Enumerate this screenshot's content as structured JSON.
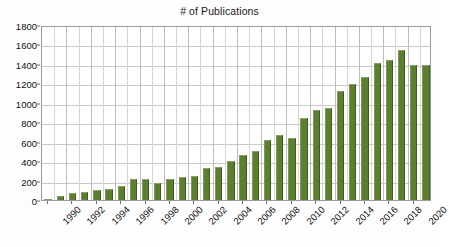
{
  "chart": {
    "title": "# of Publications",
    "background_color": "#ffffff",
    "bar_color": "#5b7f2e",
    "grid_color": "#c9c9c9",
    "axis_color": "#9b9b9b"
  },
  "chart_data": {
    "type": "bar",
    "title": "# of Publications",
    "xlabel": "",
    "ylabel": "",
    "ylim": [
      0,
      1800
    ],
    "ytick_step": 200,
    "grid": true,
    "legend": "none",
    "series_color": "#5b7f2e",
    "yticks": [
      "0",
      "200",
      "400",
      "600",
      "800",
      "1000",
      "1200",
      "1400",
      "1600",
      "1800"
    ],
    "xticks": [
      "1990",
      "1992",
      "1994",
      "1996",
      "1998",
      "2000",
      "2002",
      "2004",
      "2006",
      "2008",
      "2010",
      "2012",
      "2014",
      "2016",
      "2018",
      "2020"
    ],
    "categories": [
      "1990",
      "1991",
      "1992",
      "1993",
      "1994",
      "1995",
      "1996",
      "1997",
      "1998",
      "1999",
      "2000",
      "2001",
      "2002",
      "2003",
      "2004",
      "2005",
      "2006",
      "2007",
      "2008",
      "2009",
      "2010",
      "2011",
      "2012",
      "2013",
      "2014",
      "2015",
      "2016",
      "2017",
      "2018",
      "2019",
      "2020",
      "2021"
    ],
    "values": [
      10,
      40,
      70,
      80,
      105,
      112,
      140,
      212,
      212,
      170,
      212,
      240,
      252,
      325,
      335,
      405,
      460,
      508,
      622,
      668,
      643,
      840,
      922,
      948,
      1122,
      1198,
      1262,
      1405,
      1445,
      1540,
      1388,
      1388
    ]
  }
}
